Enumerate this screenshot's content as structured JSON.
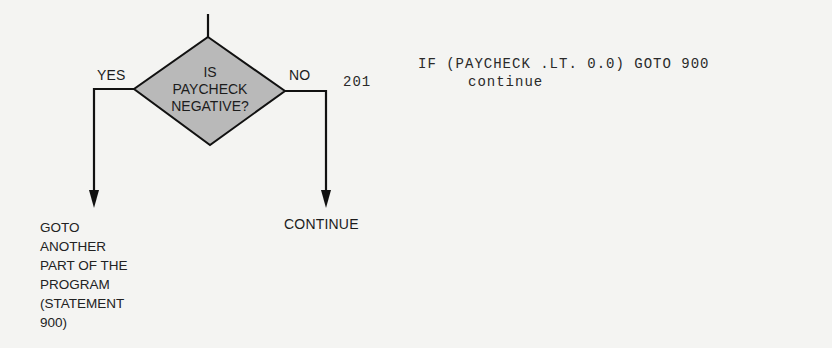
{
  "flowchart": {
    "decision": {
      "lines": [
        "IS",
        "PAYCHECK",
        "NEGATIVE?"
      ],
      "fill": "#b9b9b9",
      "stroke": "#111111"
    },
    "yes_label": "YES",
    "no_label": "NO",
    "yes_outcome": {
      "lines": [
        "GOTO",
        "ANOTHER",
        "PART OF THE",
        "PROGRAM",
        "(STATEMENT",
        "900)"
      ]
    },
    "no_outcome": "CONTINUE"
  },
  "code": {
    "line1": {
      "label": "",
      "statement": "IF (PAYCHECK .LT. 0.0) GOTO 900"
    },
    "line2": {
      "label": "201",
      "statement": "continue"
    }
  }
}
